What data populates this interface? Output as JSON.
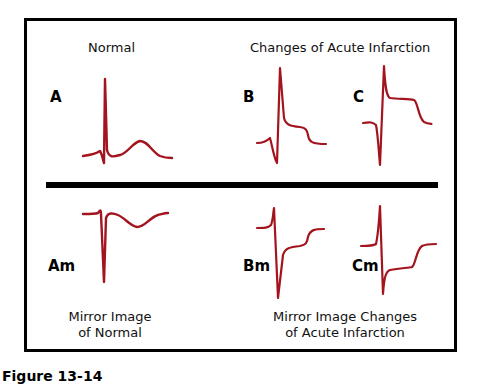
{
  "figure": {
    "top_left_title": "Normal",
    "top_right_title": "Changes of Acute Infarction",
    "bottom_left_title_line1": "Mirror Image",
    "bottom_left_title_line2": "of Normal",
    "bottom_right_title_line1": "Mirror Image Changes",
    "bottom_right_title_line2": "of Acute Infarction",
    "labels": {
      "a": "A",
      "b": "B",
      "c": "C",
      "am": "Am",
      "bm": "Bm",
      "cm": "Cm"
    },
    "trace_color": "#a3141e",
    "caption": "Figure 13-14"
  }
}
